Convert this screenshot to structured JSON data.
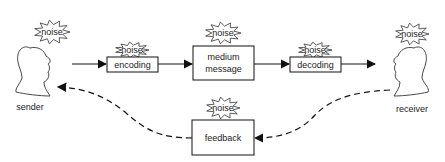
{
  "diagram": {
    "nodes": {
      "sender": "sender",
      "receiver": "receiver",
      "encoding": "encoding",
      "medium_line1": "medium",
      "medium_line2": "message",
      "decoding": "decoding",
      "feedback": "feedback"
    },
    "noise_label": "noise",
    "noise_labels": [
      "noise",
      "noise",
      "noise",
      "noise",
      "noise",
      "noise"
    ],
    "edges": [
      {
        "from": "sender",
        "to": "encoding",
        "style": "solid"
      },
      {
        "from": "encoding",
        "to": "medium",
        "style": "solid"
      },
      {
        "from": "medium",
        "to": "decoding",
        "style": "solid"
      },
      {
        "from": "decoding",
        "to": "receiver",
        "style": "solid"
      },
      {
        "from": "receiver",
        "to": "feedback",
        "style": "dashed"
      },
      {
        "from": "feedback",
        "to": "sender",
        "style": "dashed"
      }
    ],
    "colors": {
      "stroke": "#111111",
      "background": "#ffffff",
      "text": "#222222"
    }
  }
}
